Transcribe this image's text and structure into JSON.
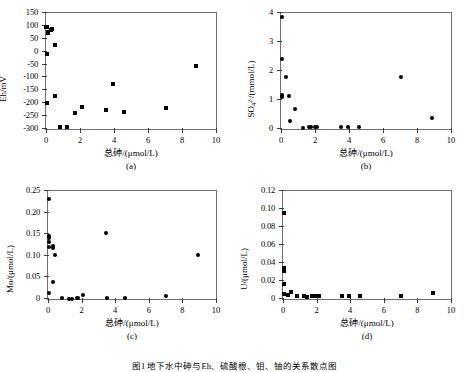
{
  "figure": {
    "caption": "图1  地下水中砷与Eh、硫酸根、钼、铀的关系散点图"
  },
  "common": {
    "xlabel": "总砷/(μmol/L)",
    "xticks": [
      "0",
      "2",
      "4",
      "6",
      "8",
      "10"
    ],
    "xlim": [
      0,
      10
    ]
  },
  "panels": [
    {
      "key": "a",
      "sublabel": "(a)",
      "ylabel": "Eh/mV",
      "yticks": [
        "-300",
        "-250",
        "-200",
        "-150",
        "-100",
        "-50",
        "0",
        "50",
        "100",
        "150"
      ]
    },
    {
      "key": "b",
      "sublabel": "(b)",
      "ylabel_html": "SO<sub>4</sub><sup>2-</sup>/(mmol/L)",
      "yticks": [
        "0",
        "1",
        "2",
        "3",
        "4"
      ]
    },
    {
      "key": "c",
      "sublabel": "(c)",
      "ylabel": "Mo/(μmol/L)",
      "yticks": [
        "0",
        "0.05",
        "0.10",
        "0.15",
        "0.20",
        "0.25"
      ]
    },
    {
      "key": "d",
      "sublabel": "(d)",
      "ylabel": "U/(μmol/L)",
      "yticks": [
        "0",
        "0.02",
        "0.04",
        "0.06",
        "0.08",
        "0.10",
        "0.12"
      ]
    }
  ],
  "chart_data": [
    {
      "type": "scatter",
      "panel": "a",
      "title": "(a)",
      "xlabel": "总砷/(μmol/L)",
      "ylabel": "Eh/mV",
      "xlim": [
        0,
        10
      ],
      "ylim": [
        -300,
        150
      ],
      "xticks": [
        0,
        2,
        4,
        6,
        8,
        10
      ],
      "yticks": [
        -300,
        -250,
        -200,
        -150,
        -100,
        -50,
        0,
        50,
        100,
        150
      ],
      "grid": false,
      "legend": "none",
      "points": [
        {
          "x": 0.02,
          "y": 97
        },
        {
          "x": 0.05,
          "y": 95
        },
        {
          "x": 0.1,
          "y": 72
        },
        {
          "x": 0.12,
          "y": 78
        },
        {
          "x": 0.35,
          "y": 88
        },
        {
          "x": 0.3,
          "y": 86
        },
        {
          "x": 0.55,
          "y": 25
        },
        {
          "x": 0.05,
          "y": -10
        },
        {
          "x": 0.5,
          "y": -172
        },
        {
          "x": 0.03,
          "y": -201
        },
        {
          "x": 0.85,
          "y": -291
        },
        {
          "x": 1.25,
          "y": -292
        },
        {
          "x": 1.7,
          "y": -236
        },
        {
          "x": 2.1,
          "y": -215
        },
        {
          "x": 3.5,
          "y": -227
        },
        {
          "x": 3.95,
          "y": -127
        },
        {
          "x": 4.6,
          "y": -235
        },
        {
          "x": 7.05,
          "y": -218
        },
        {
          "x": 8.85,
          "y": -54
        }
      ]
    },
    {
      "type": "scatter",
      "panel": "b",
      "title": "(b)",
      "xlabel": "总砷/(μmol/L)",
      "ylabel": "SO4^2-/(mmol/L)",
      "xlim": [
        0,
        10
      ],
      "ylim": [
        0,
        4
      ],
      "xticks": [
        0,
        2,
        4,
        6,
        8,
        10
      ],
      "yticks": [
        0,
        1,
        2,
        3,
        4
      ],
      "grid": false,
      "legend": "none",
      "points": [
        {
          "x": 0.03,
          "y": 3.85
        },
        {
          "x": 0.04,
          "y": 2.42
        },
        {
          "x": 0.3,
          "y": 1.78
        },
        {
          "x": 0.03,
          "y": 1.18
        },
        {
          "x": 0.05,
          "y": 1.12
        },
        {
          "x": 0.45,
          "y": 1.13
        },
        {
          "x": 0.8,
          "y": 0.68
        },
        {
          "x": 0.52,
          "y": 0.26
        },
        {
          "x": 1.3,
          "y": 0.04
        },
        {
          "x": 1.65,
          "y": 0.06
        },
        {
          "x": 1.75,
          "y": 0.06
        },
        {
          "x": 2.0,
          "y": 0.07
        },
        {
          "x": 2.1,
          "y": 0.06
        },
        {
          "x": 3.5,
          "y": 0.06
        },
        {
          "x": 3.95,
          "y": 0.06
        },
        {
          "x": 4.6,
          "y": 0.06
        },
        {
          "x": 7.05,
          "y": 1.8
        },
        {
          "x": 8.9,
          "y": 0.38
        }
      ]
    },
    {
      "type": "scatter",
      "panel": "c",
      "title": "(c)",
      "xlabel": "总砷/(μmol/L)",
      "ylabel": "Mo/(μmol/L)",
      "xlim": [
        0,
        10
      ],
      "ylim": [
        0,
        0.25
      ],
      "xticks": [
        0,
        2,
        4,
        6,
        8,
        10
      ],
      "yticks": [
        0,
        0.05,
        0.1,
        0.15,
        0.2,
        0.25
      ],
      "grid": false,
      "legend": "none",
      "points": [
        {
          "x": 0.03,
          "y": 0.232
        },
        {
          "x": 0.03,
          "y": 0.145
        },
        {
          "x": 0.04,
          "y": 0.142
        },
        {
          "x": 0.05,
          "y": 0.131
        },
        {
          "x": 0.05,
          "y": 0.12
        },
        {
          "x": 0.3,
          "y": 0.122
        },
        {
          "x": 0.32,
          "y": 0.119
        },
        {
          "x": 0.42,
          "y": 0.103
        },
        {
          "x": 0.3,
          "y": 0.039
        },
        {
          "x": 0.03,
          "y": 0.013
        },
        {
          "x": 0.85,
          "y": 0.002
        },
        {
          "x": 1.25,
          "y": 0.001
        },
        {
          "x": 1.45,
          "y": 0.001
        },
        {
          "x": 1.7,
          "y": 0.003
        },
        {
          "x": 1.8,
          "y": 0.003
        },
        {
          "x": 2.1,
          "y": 0.009
        },
        {
          "x": 3.45,
          "y": 0.152
        },
        {
          "x": 3.5,
          "y": 0.002
        },
        {
          "x": 4.6,
          "y": 0.002
        },
        {
          "x": 7.05,
          "y": 0.006
        },
        {
          "x": 8.9,
          "y": 0.101
        }
      ]
    },
    {
      "type": "scatter",
      "panel": "d",
      "title": "(d)",
      "xlabel": "总砷/(μmol/L)",
      "ylabel": "U/(μmol/L)",
      "xlim": [
        0,
        10
      ],
      "ylim": [
        0,
        0.12
      ],
      "xticks": [
        0,
        2,
        4,
        6,
        8,
        10
      ],
      "yticks": [
        0,
        0.02,
        0.04,
        0.06,
        0.08,
        0.1,
        0.12
      ],
      "grid": false,
      "legend": "none",
      "points": [
        {
          "x": 0.04,
          "y": 0.096
        },
        {
          "x": 0.04,
          "y": 0.034
        },
        {
          "x": 0.05,
          "y": 0.032
        },
        {
          "x": 0.06,
          "y": 0.031
        },
        {
          "x": 0.03,
          "y": 0.017
        },
        {
          "x": 0.05,
          "y": 0.006
        },
        {
          "x": 0.3,
          "y": 0.005
        },
        {
          "x": 0.45,
          "y": 0.008
        },
        {
          "x": 0.85,
          "y": 0.003
        },
        {
          "x": 1.25,
          "y": 0.003
        },
        {
          "x": 1.45,
          "y": 0.002
        },
        {
          "x": 1.7,
          "y": 0.003
        },
        {
          "x": 1.8,
          "y": 0.003
        },
        {
          "x": 2.05,
          "y": 0.003
        },
        {
          "x": 2.15,
          "y": 0.003
        },
        {
          "x": 3.5,
          "y": 0.003
        },
        {
          "x": 3.95,
          "y": 0.003
        },
        {
          "x": 4.6,
          "y": 0.003
        },
        {
          "x": 7.05,
          "y": 0.003
        },
        {
          "x": 8.9,
          "y": 0.007
        }
      ]
    }
  ]
}
